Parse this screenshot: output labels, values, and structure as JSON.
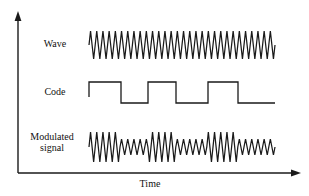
{
  "figure": {
    "background_color": "#ffffff",
    "line_color": "#1a1a1a",
    "text_color": "#111111",
    "axes": {
      "x_label": "Time",
      "y_label": "",
      "x_axis_origin_x": 18,
      "x_axis_y": 173,
      "x_axis_end_x": 300,
      "y_axis_top_y": 14,
      "arrowheads": true,
      "tick_labels_x": [],
      "tick_labels_y": []
    },
    "rows": [
      {
        "id": "wave",
        "label": "Wave",
        "label_lines": [
          "Wave"
        ]
      },
      {
        "id": "code",
        "label": "Code",
        "label_lines": [
          "Code"
        ]
      },
      {
        "id": "modulated",
        "label": "Modulated signal",
        "label_lines": [
          "Modulated",
          "signal"
        ]
      }
    ]
  },
  "chart_data": {
    "type": "line",
    "xlabel": "Time",
    "ylabel": "",
    "grid": false,
    "legend": "none",
    "xlim": [
      89,
      275
    ],
    "series": [
      {
        "name": "Wave",
        "kind": "triangle-carrier",
        "description": "Constant-amplitude, constant-frequency triangular carrier wave",
        "x_start": 89,
        "x_end": 275,
        "baseline_y": 45,
        "amplitude": 14,
        "cycles": 30,
        "amplitude_envelope": [
          1
        ]
      },
      {
        "name": "Code",
        "kind": "square-digital",
        "description": "Binary pseudo-noise spreading code, NRZ square wave",
        "x_start": 89,
        "x_end": 275,
        "high_y": 82,
        "low_y": 103,
        "bits": [
          1,
          0,
          1,
          0,
          1,
          0
        ],
        "transitions_x": [
          89,
          121,
          148,
          176,
          208,
          238,
          275
        ],
        "levels": [
          "high",
          "low",
          "high",
          "low",
          "high",
          "low"
        ]
      },
      {
        "name": "Modulated signal",
        "kind": "triangle-carrier-amplitude-modulated",
        "description": "Carrier whose amplitude follows the code: large amplitude on code high, small amplitude on code low",
        "x_start": 89,
        "x_end": 275,
        "baseline_y": 147,
        "amplitude_high": 15,
        "amplitude_low": 8,
        "cycles": 30,
        "segments_x": [
          89,
          121,
          148,
          176,
          208,
          238,
          275
        ],
        "segment_amplitudes": [
          15,
          8,
          15,
          8,
          15,
          8
        ]
      }
    ]
  }
}
